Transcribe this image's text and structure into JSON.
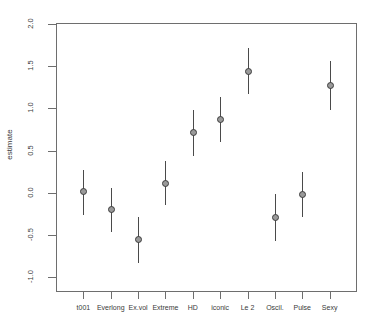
{
  "chart_data": {
    "type": "scatter",
    "title": "",
    "xlabel": "",
    "ylabel": "estimate",
    "ylim": [
      -1.25,
      2.12
    ],
    "grid": false,
    "legend": null,
    "categories": [
      "t001",
      "Everlong",
      "Ex.vol",
      "Extreme",
      "HD",
      "iconic",
      "Le 2",
      "Oscil.",
      "Pulse",
      "Sexy"
    ],
    "values": [
      0.01,
      -0.2,
      -0.56,
      0.11,
      0.71,
      0.87,
      1.44,
      -0.29,
      -0.02,
      1.27
    ],
    "error_low": [
      -0.26,
      -0.47,
      -0.84,
      -0.15,
      0.44,
      0.6,
      1.17,
      -0.57,
      -0.29,
      0.98
    ],
    "error_high": [
      0.27,
      0.06,
      -0.29,
      0.38,
      0.98,
      1.14,
      1.72,
      -0.01,
      0.25,
      1.56
    ],
    "yticks": [
      2.0,
      1.5,
      1.0,
      0.5,
      0.0,
      -0.5,
      -1.0
    ],
    "ytick_labels": [
      "2.0",
      "1.5",
      "1.0",
      "0.5",
      "0.0",
      "-0.5",
      "-1.0"
    ],
    "points": [
      {
        "label": "t001",
        "estimate": 0.01,
        "low": -0.26,
        "high": 0.27
      },
      {
        "label": "Everlong",
        "estimate": -0.2,
        "low": -0.47,
        "high": 0.06
      },
      {
        "label": "Ex.vol",
        "estimate": -0.56,
        "low": -0.84,
        "high": -0.29
      },
      {
        "label": "Extreme",
        "estimate": 0.11,
        "low": -0.15,
        "high": 0.38
      },
      {
        "label": "HD",
        "estimate": 0.71,
        "low": 0.44,
        "high": 0.98
      },
      {
        "label": "iconic",
        "estimate": 0.87,
        "low": 0.6,
        "high": 1.14
      },
      {
        "label": "Le 2",
        "estimate": 1.44,
        "low": 1.17,
        "high": 1.72
      },
      {
        "label": "Oscil.",
        "estimate": -0.29,
        "low": -0.57,
        "high": -0.01
      },
      {
        "label": "Pulse",
        "estimate": -0.02,
        "low": -0.29,
        "high": 0.25
      },
      {
        "label": "Sexy",
        "estimate": 1.27,
        "low": 0.98,
        "high": 1.56
      }
    ],
    "colors": {
      "axis": "#6e6e6e",
      "text": "#3a3a3a",
      "marker_edge": "#3d3d3d",
      "marker_fill": "#9a9a9a",
      "errorbar": "#4a4a4a"
    }
  }
}
